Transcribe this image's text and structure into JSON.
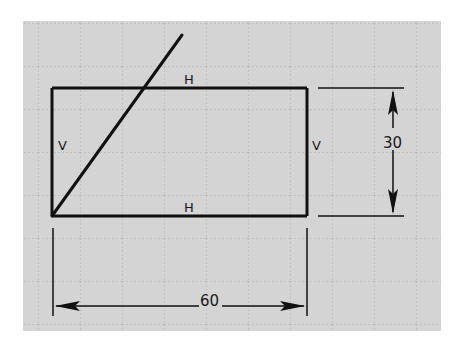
{
  "sketch": {
    "background_color": "#d4d4d4",
    "grid_color": "#b3b3b3",
    "line_color": "#111111",
    "canvas": {
      "x": 23,
      "y": 21,
      "width": 418,
      "height": 310
    },
    "grid_spacing": 42,
    "rectangle": {
      "x": 52,
      "y": 88,
      "width": 255,
      "height": 128
    },
    "diagonal": {
      "x1": 52,
      "y1": 216,
      "x2": 182,
      "y2": 35
    },
    "constraints": {
      "top_label": "H",
      "bottom_label": "H",
      "left_label": "V",
      "right_label": "V"
    },
    "dimensions": {
      "height_value": "30",
      "width_value": "60"
    }
  }
}
